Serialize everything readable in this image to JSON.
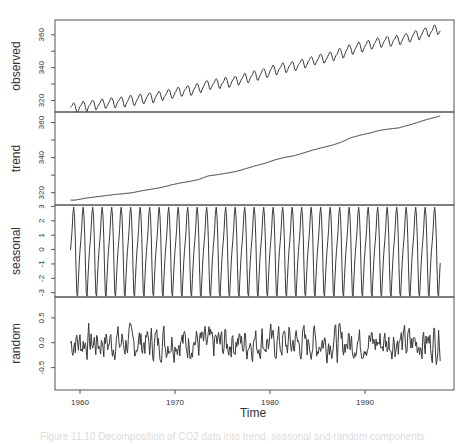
{
  "chart_data": {
    "type": "line",
    "xlabel": "Time",
    "x_ticks": [
      1960,
      1970,
      1980,
      1990
    ],
    "x_range": [
      1959.0,
      1997.917
    ],
    "frequency": 12,
    "panels": [
      {
        "name": "observed",
        "ylabel": "observed",
        "y_ticks": [
          320,
          340,
          360
        ],
        "ylim": [
          313,
          369
        ],
        "description": "Monthly CO2 concentration, rising trend plus seasonal cycle",
        "start_value": 315.4,
        "end_value": 364.5
      },
      {
        "name": "trend",
        "ylabel": "trend",
        "y_ticks": [
          320,
          340,
          360
        ],
        "ylim": [
          313,
          366
        ],
        "annual_years": [
          1959,
          1960,
          1961,
          1962,
          1963,
          1964,
          1965,
          1966,
          1967,
          1968,
          1969,
          1970,
          1971,
          1972,
          1973,
          1974,
          1975,
          1976,
          1977,
          1978,
          1979,
          1980,
          1981,
          1982,
          1983,
          1984,
          1985,
          1986,
          1987,
          1988,
          1989,
          1990,
          1991,
          1992,
          1993,
          1994,
          1995,
          1996,
          1997
        ],
        "annual_values": [
          315.8,
          316.8,
          317.5,
          318.2,
          318.9,
          319.4,
          320.0,
          321.1,
          322.0,
          322.9,
          324.3,
          325.5,
          326.4,
          327.5,
          329.6,
          330.3,
          331.2,
          332.2,
          333.8,
          335.4,
          336.8,
          338.7,
          340.1,
          341.0,
          342.6,
          344.3,
          345.7,
          347.0,
          348.8,
          351.3,
          352.8,
          354.0,
          355.5,
          356.3,
          356.9,
          358.3,
          360.0,
          361.7,
          363.1
        ]
      },
      {
        "name": "seasonal",
        "ylabel": "seasonal",
        "y_ticks": [
          -3,
          -2,
          -1,
          0,
          1,
          2,
          3
        ],
        "ylim": [
          -3.3,
          3.1
        ],
        "monthly_profile": [
          -0.05,
          0.61,
          1.38,
          2.5,
          2.95,
          2.32,
          0.82,
          -1.25,
          -3.05,
          -3.25,
          -2.06,
          -0.94
        ]
      },
      {
        "name": "random",
        "ylabel": "random",
        "y_ticks": [
          -0.5,
          0.0,
          0.5
        ],
        "ylim": [
          -0.95,
          0.92
        ],
        "range_observed": [
          -0.9,
          0.8
        ]
      }
    ]
  },
  "labels": {
    "observed": "observed",
    "trend": "trend",
    "seasonal": "seasonal",
    "random": "random",
    "xlabel": "Time"
  },
  "caption": "Figure 11.10  Decomposition of CO2 data into trend, seasonal and random components"
}
